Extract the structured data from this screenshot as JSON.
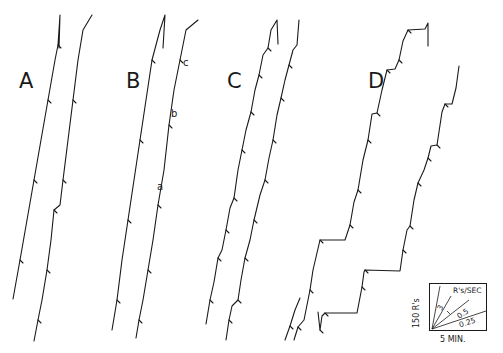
{
  "figure": {
    "type": "cumulative-response-records",
    "panels": [
      {
        "label": "A"
      },
      {
        "label": "B",
        "point_labels": [
          "a",
          "b",
          "c"
        ]
      },
      {
        "label": "C"
      },
      {
        "label": "D"
      }
    ],
    "legend": {
      "y_scale": "150 R's",
      "x_scale": "5 MIN.",
      "rate_title": "R's/SEC",
      "rates": [
        "3",
        "0.5",
        "0.25"
      ]
    }
  },
  "chart_data": {
    "type": "line",
    "title": "",
    "xlabel": "time (5 MIN. scale bar)",
    "ylabel": "cumulative responses (150 R's scale bar)",
    "legend_rates_rps": [
      3,
      0.5,
      0.25
    ],
    "series": [
      {
        "name": "A-1",
        "points": [
          [
            13,
            299
          ],
          [
            20,
            260
          ],
          [
            27,
            220
          ],
          [
            34,
            180
          ],
          [
            41,
            140
          ],
          [
            48,
            100
          ],
          [
            55,
            60
          ],
          [
            58,
            45
          ],
          [
            60,
            15
          ],
          [
            59,
            48
          ]
        ]
      },
      {
        "name": "A-2",
        "points": [
          [
            34,
            341
          ],
          [
            38,
            320
          ],
          [
            42,
            300
          ],
          [
            47,
            270
          ],
          [
            51,
            240
          ],
          [
            54,
            210
          ],
          [
            60,
            205
          ],
          [
            63,
            180
          ],
          [
            68,
            140
          ],
          [
            73,
            100
          ],
          [
            78,
            60
          ],
          [
            83,
            30
          ],
          [
            92,
            15
          ]
        ]
      },
      {
        "name": "B-1",
        "points": [
          [
            112,
            330
          ],
          [
            117,
            300
          ],
          [
            122,
            260
          ],
          [
            128,
            220
          ],
          [
            134,
            180
          ],
          [
            140,
            140
          ],
          [
            146,
            100
          ],
          [
            152,
            60
          ],
          [
            160,
            30
          ],
          [
            165,
            15
          ],
          [
            163,
            48
          ]
        ]
      },
      {
        "name": "B-2",
        "points": [
          [
            136,
            338
          ],
          [
            139,
            320
          ],
          [
            143,
            300
          ],
          [
            148,
            270
          ],
          [
            153,
            240
          ],
          [
            158,
            205
          ],
          [
            164,
            170
          ],
          [
            169,
            125
          ],
          [
            174,
            90
          ],
          [
            180,
            60
          ],
          [
            186,
            30
          ],
          [
            198,
            20
          ]
        ]
      },
      {
        "name": "C-1",
        "points": [
          [
            206,
            324
          ],
          [
            210,
            300
          ],
          [
            214,
            282
          ],
          [
            218,
            258
          ],
          [
            222,
            250
          ],
          [
            226,
            230
          ],
          [
            230,
            208
          ],
          [
            234,
            198
          ],
          [
            238,
            170
          ],
          [
            242,
            150
          ],
          [
            246,
            130
          ],
          [
            251,
            112
          ],
          [
            255,
            90
          ],
          [
            259,
            75
          ],
          [
            263,
            55
          ],
          [
            268,
            48
          ],
          [
            271,
            30
          ],
          [
            277,
            20
          ],
          [
            278,
            44
          ]
        ]
      },
      {
        "name": "C-2",
        "points": [
          [
            226,
            340
          ],
          [
            229,
            320
          ],
          [
            232,
            306
          ],
          [
            238,
            300
          ],
          [
            241,
            280
          ],
          [
            245,
            258
          ],
          [
            250,
            240
          ],
          [
            254,
            220
          ],
          [
            260,
            195
          ],
          [
            265,
            180
          ],
          [
            269,
            158
          ],
          [
            273,
            140
          ],
          [
            277,
            115
          ],
          [
            281,
            98
          ],
          [
            285,
            80
          ],
          [
            289,
            65
          ],
          [
            293,
            50
          ],
          [
            297,
            45
          ],
          [
            299,
            20
          ]
        ]
      },
      {
        "name": "C-3",
        "points": [
          [
            285,
            340
          ],
          [
            290,
            326
          ],
          [
            295,
            310
          ],
          [
            300,
            298
          ]
        ]
      },
      {
        "name": "D-1",
        "points": [
          [
            294,
            340
          ],
          [
            298,
            327
          ],
          [
            304,
            320
          ],
          [
            310,
            290
          ],
          [
            313,
            270
          ],
          [
            320,
            240
          ],
          [
            345,
            240
          ],
          [
            350,
            225
          ],
          [
            354,
            202
          ],
          [
            358,
            190
          ],
          [
            363,
            160
          ],
          [
            368,
            140
          ],
          [
            372,
            114
          ],
          [
            377,
            113
          ],
          [
            382,
            90
          ],
          [
            387,
            70
          ],
          [
            395,
            69
          ],
          [
            399,
            60
          ],
          [
            403,
            41
          ],
          [
            408,
            30
          ],
          [
            425,
            29
          ],
          [
            428,
            23
          ],
          [
            428,
            46
          ]
        ]
      },
      {
        "name": "D-2",
        "points": [
          [
            318,
            312
          ],
          [
            320,
            330
          ],
          [
            322,
            316
          ],
          [
            325,
            313
          ],
          [
            357,
            313
          ],
          [
            362,
            287
          ],
          [
            364,
            272
          ],
          [
            365,
            270
          ],
          [
            400,
            271
          ],
          [
            403,
            250
          ],
          [
            407,
            230
          ],
          [
            410,
            226
          ],
          [
            414,
            200
          ],
          [
            418,
            183
          ],
          [
            424,
            170
          ],
          [
            428,
            158
          ],
          [
            431,
            146
          ],
          [
            437,
            145
          ],
          [
            442,
            112
          ],
          [
            445,
            104
          ],
          [
            452,
            104
          ],
          [
            456,
            88
          ],
          [
            459,
            66
          ]
        ]
      }
    ]
  }
}
